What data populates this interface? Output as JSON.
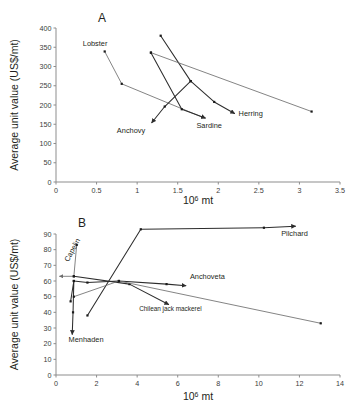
{
  "figure": {
    "background_color": "#ffffff",
    "line_color": "#6e6e6e",
    "arrow_color": "#2d2d2d",
    "point_color": "#1a1a1a",
    "axis_color": "#8d8d8d"
  },
  "chart_data": [
    {
      "type": "line",
      "panel": "A",
      "title": "A",
      "xlabel": "10⁶ mt",
      "ylabel": "Average unit value (US$/mt)",
      "xlim": [
        0,
        3.5
      ],
      "ylim": [
        0,
        400
      ],
      "xticks": [
        0,
        0.5,
        1,
        1.5,
        2,
        2.5,
        3,
        3.5
      ],
      "xtick_labels": [
        "0",
        "0.5",
        "1",
        "1.5",
        "2",
        "2.5",
        "3",
        "3.5"
      ],
      "yticks": [
        0,
        50,
        100,
        150,
        200,
        250,
        300,
        350,
        400
      ],
      "ytick_labels": [
        "0",
        "50",
        "100",
        "150",
        "200",
        "250",
        "300",
        "350",
        "400"
      ],
      "grid": false,
      "legend": "none",
      "series": [
        {
          "name": "Lobster",
          "label": "Lobster",
          "label_x": 0.33,
          "label_y": 352,
          "arrow": true,
          "emphasis": "light",
          "x": [
            0.6,
            0.81,
            1.83
          ],
          "y": [
            339,
            255,
            166
          ]
        },
        {
          "name": "Anchovy",
          "label": "Anchovy",
          "label_x": 0.75,
          "label_y": 128,
          "arrow": true,
          "emphasis": "dark",
          "x": [
            1.29,
            1.66,
            1.34,
            1.18
          ],
          "y": [
            380,
            262,
            196,
            154
          ]
        },
        {
          "name": "Sardine",
          "label": "Sardine",
          "label_x": 1.73,
          "label_y": 139,
          "arrow": true,
          "emphasis": "dark",
          "x": [
            1.17,
            1.55,
            1.84
          ],
          "y": [
            336,
            189,
            166
          ]
        },
        {
          "name": "Herring",
          "label": "Herring",
          "label_x": 2.25,
          "label_y": 172,
          "arrow": true,
          "emphasis": "dark",
          "x": [
            1.66,
            1.95,
            2.2
          ],
          "y": [
            262,
            208,
            178
          ]
        },
        {
          "name": "Lobster-long-decline",
          "label": "",
          "arrow": false,
          "emphasis": "light",
          "x": [
            1.17,
            3.15
          ],
          "y": [
            336,
            183
          ]
        }
      ]
    },
    {
      "type": "line",
      "panel": "B",
      "title": "B",
      "xlabel": "10⁶ mt",
      "ylabel": "Average unit value (US$/mt)",
      "xlim": [
        0,
        14
      ],
      "ylim": [
        0,
        90
      ],
      "xticks": [
        0,
        2,
        4,
        6,
        8,
        10,
        12,
        14
      ],
      "xtick_labels": [
        "0",
        "2",
        "4",
        "6",
        "8",
        "10",
        "12",
        "14"
      ],
      "yticks": [
        0,
        10,
        20,
        30,
        40,
        50,
        60,
        70,
        80,
        90
      ],
      "ytick_labels": [
        "0",
        "10",
        "20",
        "30",
        "40",
        "50",
        "60",
        "70",
        "80",
        "90"
      ],
      "grid": false,
      "legend": "none",
      "series": [
        {
          "name": "Capelin",
          "label": "Capelin",
          "label_x": 0.62,
          "label_y": 72,
          "label_rotation": -62,
          "arrow": true,
          "emphasis": "light",
          "x": [
            1.02,
            0.88,
            0.18
          ],
          "y": [
            83,
            63,
            63
          ]
        },
        {
          "name": "Menhaden",
          "label": "Menhaden",
          "label_x": 0.62,
          "label_y": 21,
          "arrow": true,
          "emphasis": "dark",
          "x": [
            0.72,
            0.88,
            0.84,
            0.8
          ],
          "y": [
            47,
            60,
            40,
            26
          ]
        },
        {
          "name": "Anchoveta",
          "label": "Anchoveta",
          "label_x": 6.6,
          "label_y": 61,
          "arrow": true,
          "emphasis": "dark",
          "x": [
            0.88,
            1.55,
            3.1,
            5.45,
            6.4
          ],
          "y": [
            60,
            59,
            60,
            58,
            57
          ]
        },
        {
          "name": "Chilean jack mackerel",
          "label": "Chilean jack mackerel",
          "label_x": 4.1,
          "label_y": 41,
          "arrow": true,
          "emphasis": "dark",
          "x": [
            0.88,
            3.62,
            5.55
          ],
          "y": [
            63,
            58,
            45
          ]
        },
        {
          "name": "Pilchard",
          "label": "Pilchard",
          "label_x": 11.1,
          "label_y": 89,
          "arrow": true,
          "emphasis": "dark",
          "x": [
            1.55,
            4.18,
            10.25,
            11.8
          ],
          "y": [
            38,
            93,
            94,
            95
          ]
        },
        {
          "name": "Pilchard-decline",
          "label": "",
          "arrow": false,
          "emphasis": "light",
          "x": [
            0.88,
            3.1,
            13.05
          ],
          "y": [
            50,
            60,
            33
          ]
        }
      ]
    }
  ]
}
